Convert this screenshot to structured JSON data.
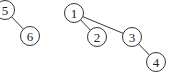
{
  "diagram": {
    "type": "graph",
    "nodes": [
      {
        "id": "5",
        "label": "5",
        "x": 5,
        "y": 10
      },
      {
        "id": "6",
        "label": "6",
        "x": 30,
        "y": 36
      },
      {
        "id": "1",
        "label": "1",
        "x": 74,
        "y": 13
      },
      {
        "id": "2",
        "label": "2",
        "x": 97,
        "y": 37
      },
      {
        "id": "3",
        "label": "3",
        "x": 132,
        "y": 37
      },
      {
        "id": "4",
        "label": "4",
        "x": 156,
        "y": 62
      }
    ],
    "edges": [
      {
        "from": "5",
        "to": "6"
      },
      {
        "from": "1",
        "to": "2"
      },
      {
        "from": "1",
        "to": "3"
      },
      {
        "from": "3",
        "to": "4"
      }
    ],
    "node_radius": 9.5,
    "colors": {
      "stroke": "#333333",
      "fill": "#ffffff",
      "text": "#222222"
    }
  }
}
